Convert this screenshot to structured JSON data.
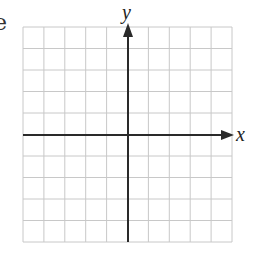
{
  "figure": {
    "type": "coordinate_plane",
    "fragment_text": "e",
    "x_axis_label": "x",
    "y_axis_label": "y",
    "grid": {
      "columns": 10,
      "rows": 10,
      "left": 23,
      "top": 27,
      "right": 232,
      "bottom": 242
    },
    "origin": {
      "px": 128,
      "py": 135
    },
    "colors": {
      "grid": "#c8c8c8",
      "axis": "#2a2a2a",
      "background": "#ffffff"
    }
  }
}
